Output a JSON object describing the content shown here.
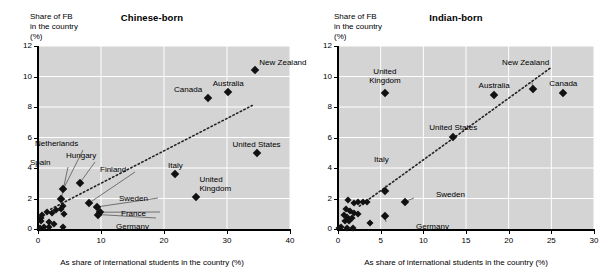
{
  "figure": {
    "background": "#ffffff",
    "plot_background": "#d4d4d4",
    "marker_color": "#111111",
    "gridline_color": "#ffffff",
    "axis_color": "#000000"
  },
  "chart_data": [
    {
      "type": "scatter",
      "title": "Chinese-born",
      "ylabel": "Share of FB\nin the country\n(%)",
      "xlabel": "As share of international students in the country (%)",
      "xlim": [
        0,
        40
      ],
      "ylim": [
        0,
        12
      ],
      "xticks": [
        0,
        10,
        20,
        30,
        40
      ],
      "yticks": [
        0,
        2,
        4,
        6,
        8,
        10,
        12
      ],
      "xticklabels": [
        "0",
        "10",
        "20",
        "30",
        "40"
      ],
      "yticklabels": [
        "0",
        "2",
        "4",
        "6",
        "8",
        "10",
        "12"
      ],
      "grid": true,
      "legend": "none",
      "trendline": {
        "style": "dotted",
        "x": [
          2.0,
          34.0
        ],
        "y": [
          1.3,
          8.1
        ]
      },
      "points": [
        {
          "label": "New Zealand",
          "x": 34.5,
          "y": 10.4,
          "label_dx": 4,
          "label_dy": -12,
          "label_align": "left"
        },
        {
          "label": "Australia",
          "x": 30.2,
          "y": 9.0,
          "label_dx": 0,
          "label_dy": -13,
          "label_align": "center"
        },
        {
          "label": "Canada",
          "x": 27.0,
          "y": 8.6,
          "label_dx": -6,
          "label_dy": -13,
          "label_align": "right"
        },
        {
          "label": "United States",
          "x": 34.7,
          "y": 5.0,
          "label_dx": 0,
          "label_dy": -13,
          "label_align": "center"
        },
        {
          "label": "Italy",
          "x": 21.8,
          "y": 3.6,
          "label_dx": 0,
          "label_dy": -13,
          "label_align": "center"
        },
        {
          "label": "United\nKingdom",
          "x": 25.0,
          "y": 2.1,
          "label_dx": 4,
          "label_dy": -22,
          "label_align": "left"
        },
        {
          "label": "Hungary",
          "x": 6.6,
          "y": 3.0,
          "label_dx": 0,
          "label_dy": 0,
          "label_align": "callout"
        },
        {
          "label": "Netherlands",
          "x": 4.0,
          "y": 2.6,
          "label_dx": 0,
          "label_dy": 0,
          "label_align": "callout"
        },
        {
          "label": "Spain",
          "x": 3.7,
          "y": 2.0,
          "label_dx": 0,
          "label_dy": 0,
          "label_align": "callout"
        },
        {
          "label": "Finland",
          "x": 8.1,
          "y": 1.7,
          "label_dx": 0,
          "label_dy": 0,
          "label_align": "callout"
        },
        {
          "label": "Sweden",
          "x": 9.4,
          "y": 1.45,
          "label_dx": 0,
          "label_dy": 0,
          "label_align": "callout"
        },
        {
          "label": "France",
          "x": 9.8,
          "y": 1.1,
          "label_dx": 0,
          "label_dy": 0,
          "label_align": "callout"
        },
        {
          "label": "Germany",
          "x": 9.6,
          "y": 0.95,
          "label_dx": 0,
          "label_dy": 0,
          "label_align": "callout"
        },
        {
          "label": "",
          "x": 4.0,
          "y": 1.5
        },
        {
          "label": "",
          "x": 3.6,
          "y": 1.3
        },
        {
          "label": "",
          "x": 2.9,
          "y": 1.25
        },
        {
          "label": "",
          "x": 4.1,
          "y": 1.0
        },
        {
          "label": "",
          "x": 2.3,
          "y": 1.05
        },
        {
          "label": "",
          "x": 1.5,
          "y": 1.1
        },
        {
          "label": "",
          "x": 0.7,
          "y": 0.9
        },
        {
          "label": "",
          "x": 0.5,
          "y": 0.7
        },
        {
          "label": "",
          "x": 0.4,
          "y": 0.55
        },
        {
          "label": "",
          "x": 1.8,
          "y": 0.45
        },
        {
          "label": "",
          "x": 2.6,
          "y": 0.35
        },
        {
          "label": "",
          "x": 0.9,
          "y": 0.15
        },
        {
          "label": "",
          "x": 1.7,
          "y": 0.1
        },
        {
          "label": "",
          "x": 3.9,
          "y": 0.1
        },
        {
          "label": "",
          "x": 0.3,
          "y": 0.05
        }
      ]
    },
    {
      "type": "scatter",
      "title": "Indian-born",
      "ylabel": "Share of FB\nin the country\n(%)",
      "xlabel": "As share of international students in the country (%)",
      "xlim": [
        0,
        30
      ],
      "ylim": [
        0,
        12
      ],
      "xticks": [
        0,
        5,
        10,
        15,
        20,
        25,
        30
      ],
      "yticks": [
        0,
        2,
        4,
        6,
        8,
        10,
        12
      ],
      "xticklabels": [
        "0",
        "5",
        "10",
        "15",
        "20",
        "25",
        "30"
      ],
      "yticklabels": [
        "0",
        "2",
        "4",
        "6",
        "8",
        "10",
        "12"
      ],
      "grid": true,
      "legend": "none",
      "trendline": {
        "style": "dotted",
        "x": [
          2.5,
          25.0
        ],
        "y": [
          1.5,
          10.6
        ]
      },
      "points": [
        {
          "label": "United\nKingdom",
          "x": 5.5,
          "y": 8.9,
          "label_dx": 0,
          "label_dy": -26,
          "label_align": "center"
        },
        {
          "label": "Australia",
          "x": 18.3,
          "y": 8.8,
          "label_dx": 0,
          "label_dy": -14,
          "label_align": "center"
        },
        {
          "label": "New Zealand",
          "x": 22.8,
          "y": 9.2,
          "label_dx": 0,
          "label_dy": 0,
          "label_align": "callout"
        },
        {
          "label": "Canada",
          "x": 26.4,
          "y": 8.9,
          "label_dx": 0,
          "label_dy": -14,
          "label_align": "center"
        },
        {
          "label": "United States",
          "x": 13.5,
          "y": 6.05,
          "label_dx": 0,
          "label_dy": -14,
          "label_align": "center"
        },
        {
          "label": "Italy",
          "x": 5.5,
          "y": 2.5,
          "label_dx": 0,
          "label_dy": 0,
          "label_align": "callout"
        },
        {
          "label": "Sweden",
          "x": 7.9,
          "y": 1.8,
          "label_dx": 0,
          "label_dy": 0,
          "label_align": "callout"
        },
        {
          "label": "Germany",
          "x": 5.5,
          "y": 0.85,
          "label_dx": 0,
          "label_dy": 0,
          "label_align": "callout"
        },
        {
          "label": "",
          "x": 1.2,
          "y": 1.9
        },
        {
          "label": "",
          "x": 2.4,
          "y": 1.8
        },
        {
          "label": "",
          "x": 2.9,
          "y": 1.75
        },
        {
          "label": "",
          "x": 3.4,
          "y": 1.75
        },
        {
          "label": "",
          "x": 1.9,
          "y": 1.7
        },
        {
          "label": "",
          "x": 0.9,
          "y": 1.3
        },
        {
          "label": "",
          "x": 1.4,
          "y": 1.15
        },
        {
          "label": "",
          "x": 1.9,
          "y": 1.05
        },
        {
          "label": "",
          "x": 2.3,
          "y": 1.0
        },
        {
          "label": "",
          "x": 0.7,
          "y": 0.9
        },
        {
          "label": "",
          "x": 1.1,
          "y": 0.8
        },
        {
          "label": "",
          "x": 1.6,
          "y": 0.75
        },
        {
          "label": "",
          "x": 0.8,
          "y": 0.55
        },
        {
          "label": "",
          "x": 1.3,
          "y": 0.5
        },
        {
          "label": "",
          "x": 3.7,
          "y": 0.4
        },
        {
          "label": "",
          "x": 0.4,
          "y": 0.1
        },
        {
          "label": "",
          "x": 1.0,
          "y": 0.08
        },
        {
          "label": "",
          "x": 1.7,
          "y": 0.08
        },
        {
          "label": "",
          "x": 0.15,
          "y": 0.05
        }
      ]
    }
  ]
}
